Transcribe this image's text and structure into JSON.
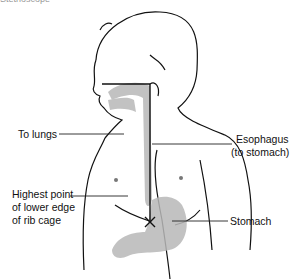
{
  "caption_partial": "Stethoscope",
  "labels": {
    "to_lungs": "To lungs",
    "esophagus_line1": "Esophagus",
    "esophagus_line2": "(to stomach)",
    "rib_line1": "Highest  point",
    "rib_line2": "of lower edge",
    "rib_line3": "of  rib cage",
    "stomach": "Stomach"
  },
  "colors": {
    "outline": "#111111",
    "shading": "#b5b5b5",
    "leader_line": "#222222"
  }
}
